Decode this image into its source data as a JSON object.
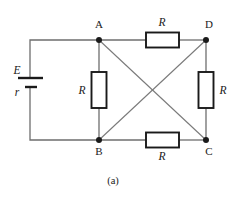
{
  "figure": {
    "caption": "(a)",
    "type": "electrical-circuit-diagram",
    "background_color": "#ffffff",
    "wire_color": "#6e6e6e",
    "ink_color": "#1a1a1a"
  },
  "source": {
    "emf_label": "E",
    "internal_resistance_label": "r"
  },
  "nodes": [
    {
      "id": "A",
      "label": "A",
      "x": 99,
      "y": 40
    },
    {
      "id": "D",
      "label": "D",
      "x": 206,
      "y": 40
    },
    {
      "id": "B",
      "label": "B",
      "x": 99,
      "y": 139
    },
    {
      "id": "C",
      "label": "C",
      "x": 206,
      "y": 139
    }
  ],
  "resistors": [
    {
      "id": "top",
      "label": "R",
      "between": "A-D",
      "orientation": "horizontal"
    },
    {
      "id": "left",
      "label": "R",
      "between": "A-B",
      "orientation": "vertical"
    },
    {
      "id": "right",
      "label": "R",
      "between": "D-C",
      "orientation": "vertical"
    },
    {
      "id": "bottom",
      "label": "R",
      "between": "B-C",
      "orientation": "horizontal"
    }
  ],
  "diagonals": [
    {
      "from": "A",
      "to": "C"
    },
    {
      "from": "B",
      "to": "D"
    }
  ]
}
